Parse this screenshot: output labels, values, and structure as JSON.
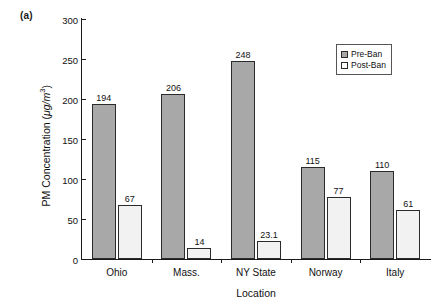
{
  "panel_label": "(a)",
  "chart_data": {
    "type": "bar",
    "title": "",
    "xlabel": "Location",
    "ylabel": "PM Concentration (μg/m³)",
    "ylabel_prefix": "PM Concentration (",
    "ylabel_unit_mu": "μg/m",
    "ylabel_unit_exp": "3",
    "ylabel_suffix": ")",
    "categories": [
      "Ohio",
      "Mass.",
      "NY State",
      "Norway",
      "Italy"
    ],
    "series": [
      {
        "name": "Pre-Ban",
        "color": "#a8a8a8",
        "values": [
          194,
          206,
          248,
          115,
          110
        ],
        "labels": [
          "194",
          "206",
          "248",
          "115",
          "110"
        ]
      },
      {
        "name": "Post-Ban",
        "color": "#f2f2f2",
        "values": [
          67,
          14,
          23.1,
          77,
          61
        ],
        "labels": [
          "67",
          "14",
          "23.1",
          "77",
          "61"
        ]
      }
    ],
    "ylim": [
      0,
      300
    ],
    "yticks": [
      0,
      50,
      100,
      150,
      200,
      250,
      300
    ],
    "ytick_labels": [
      "0",
      "50",
      "100",
      "150",
      "200",
      "250",
      "300"
    ],
    "grid": false,
    "legend_position": "top-right",
    "legend_entries": [
      "Pre-Ban",
      "Post-Ban"
    ]
  }
}
